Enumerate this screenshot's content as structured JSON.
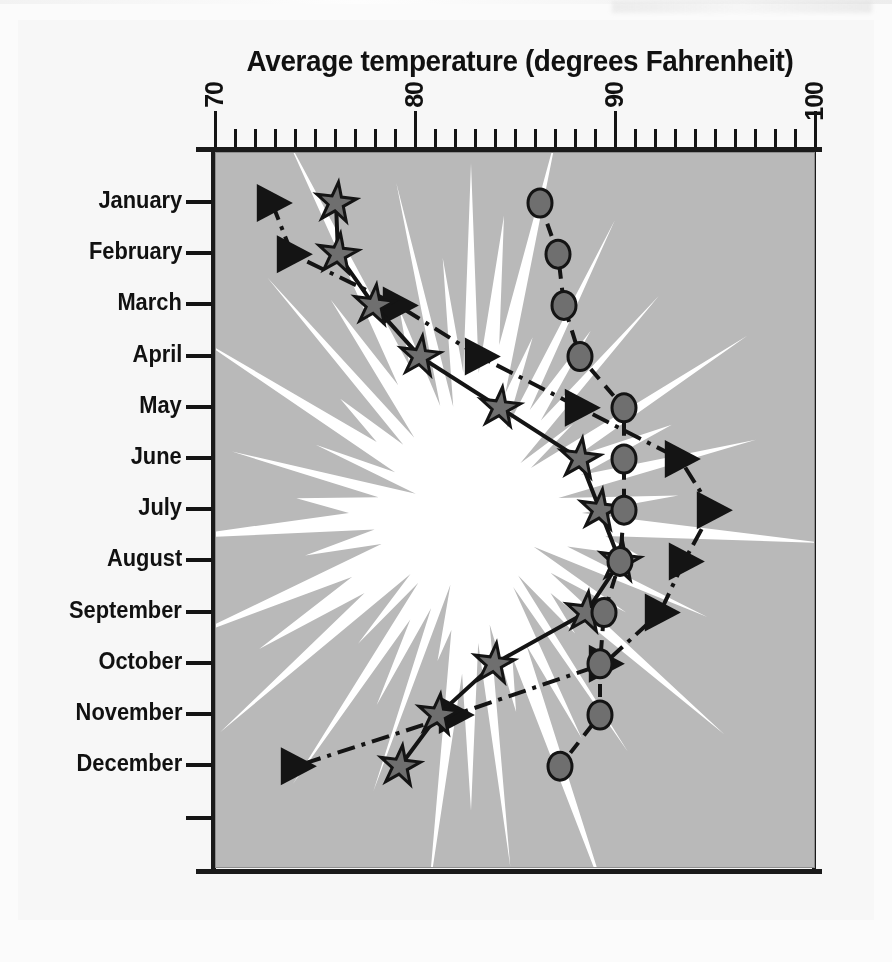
{
  "chart_data": {
    "type": "line",
    "title": "Average temperature (degrees Fahrenheit)",
    "xlabel": "Average temperature (degrees Fahrenheit)",
    "ylabel": "",
    "orientation": "horizontal",
    "xlim": [
      70,
      100
    ],
    "xticks": [
      70,
      80,
      90,
      100
    ],
    "xtick_labels": [
      "70",
      "80",
      "90",
      "100"
    ],
    "minor_tick_step": 1,
    "grid": false,
    "legend": "none",
    "categories": [
      "January",
      "February",
      "March",
      "April",
      "May",
      "June",
      "July",
      "August",
      "September",
      "October",
      "November",
      "December"
    ],
    "series": [
      {
        "name": "triangle-series",
        "marker": "triangle-right",
        "linestyle": "dash-dot",
        "values": [
          72.8,
          73.8,
          79.1,
          83.2,
          88.2,
          93.2,
          94.8,
          93.4,
          92.2,
          89.4,
          81.9,
          74.0
        ]
      },
      {
        "name": "star-series",
        "marker": "star",
        "linestyle": "solid",
        "values": [
          76.0,
          76.1,
          77.9,
          80.2,
          84.2,
          88.2,
          89.2,
          90.2,
          88.5,
          83.9,
          81.1,
          79.2
        ]
      },
      {
        "name": "circle-series",
        "marker": "circle",
        "linestyle": "dashed",
        "values": [
          86.2,
          87.1,
          87.4,
          88.2,
          90.4,
          90.4,
          90.4,
          90.2,
          89.4,
          89.2,
          89.2,
          87.2
        ]
      }
    ]
  },
  "axis": {
    "title": "Average temperature (degrees Fahrenheit)",
    "x_labels": [
      "70",
      "80",
      "90",
      "100"
    ],
    "y_labels": [
      "January",
      "February",
      "March",
      "April",
      "May",
      "June",
      "July",
      "August",
      "September",
      "October",
      "November",
      "December"
    ]
  },
  "colors": {
    "plot_background": "#b9b9b9",
    "sun_fill": "#ffffff",
    "ink": "#141414",
    "paper": "#f7f7f7",
    "marker_fill": "#6f6f6f"
  }
}
